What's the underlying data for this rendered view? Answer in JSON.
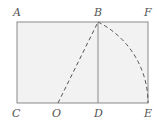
{
  "diagram": {
    "colors": {
      "fill": "#f2f2f2",
      "stroke": "#8a8a8a",
      "label": "#555555"
    },
    "points": {
      "A": {
        "label": "A",
        "x": 17,
        "y": 22
      },
      "B": {
        "label": "B",
        "x": 98,
        "y": 22
      },
      "F": {
        "label": "F",
        "x": 148,
        "y": 22
      },
      "C": {
        "label": "C",
        "x": 17,
        "y": 103
      },
      "O": {
        "label": "O",
        "x": 58,
        "y": 103
      },
      "D": {
        "label": "D",
        "x": 98,
        "y": 103
      },
      "E": {
        "label": "E",
        "x": 148,
        "y": 103
      }
    },
    "segments": [
      {
        "from": "O",
        "to": "B",
        "style": "dashed"
      },
      {
        "from": "B",
        "to": "D",
        "style": "solid"
      },
      {
        "arc": "B-E",
        "center": "O",
        "style": "dashed"
      }
    ]
  }
}
